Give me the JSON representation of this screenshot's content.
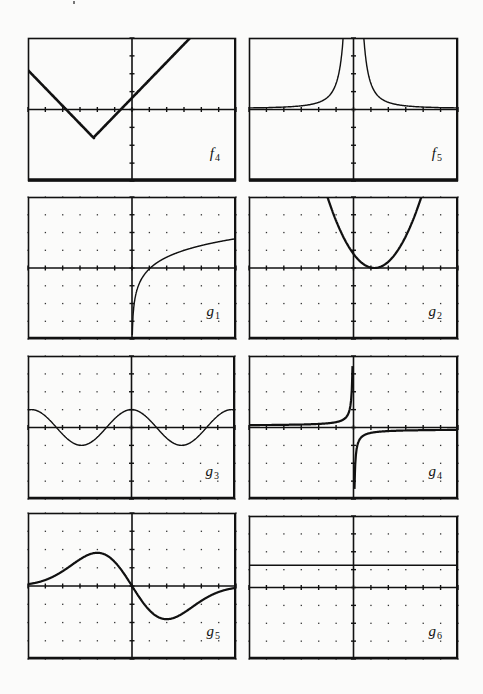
{
  "page": {
    "background": "#fbfbfa",
    "ink": "#111111"
  },
  "panels": [
    {
      "id": "f4",
      "name": "f",
      "sub": "4",
      "x": 28,
      "y": 38,
      "w": 208,
      "h": 143,
      "dots": false,
      "heavy": true
    },
    {
      "id": "f5",
      "name": "f",
      "sub": "5",
      "x": 249,
      "y": 38,
      "w": 209,
      "h": 143,
      "dots": false,
      "heavy": true
    },
    {
      "id": "g1",
      "name": "g",
      "sub": "1",
      "x": 28,
      "y": 197,
      "w": 208,
      "h": 142,
      "dots": true,
      "heavy": false
    },
    {
      "id": "g2",
      "name": "g",
      "sub": "2",
      "x": 249,
      "y": 197,
      "w": 209,
      "h": 142,
      "dots": true,
      "heavy": false
    },
    {
      "id": "g3",
      "name": "g",
      "sub": "3",
      "x": 28,
      "y": 356,
      "w": 207,
      "h": 143,
      "dots": true,
      "heavy": false
    },
    {
      "id": "g4",
      "name": "g",
      "sub": "4",
      "x": 249,
      "y": 356,
      "w": 209,
      "h": 143,
      "dots": true,
      "heavy": false
    },
    {
      "id": "g5",
      "name": "g",
      "sub": "5",
      "x": 28,
      "y": 513,
      "w": 208,
      "h": 146,
      "dots": true,
      "heavy": false
    },
    {
      "id": "g6",
      "name": "g",
      "sub": "6",
      "x": 249,
      "y": 516,
      "w": 209,
      "h": 143,
      "dots": true,
      "heavy": false
    }
  ],
  "chart_data": [
    {
      "type": "line",
      "title": "f4",
      "xlim": [
        -6,
        6
      ],
      "ylim": [
        -4,
        4
      ],
      "grid": "none",
      "description": "V-shaped absolute value graph with vertex at (-2.2,-1.6), slopes about ±1",
      "x": [
        -6,
        -2.2,
        3.5
      ],
      "y": [
        2.2,
        -1.6,
        4
      ]
    },
    {
      "type": "line",
      "title": "f5",
      "xlim": [
        -6,
        6
      ],
      "ylim": [
        -4,
        4
      ],
      "grid": "none",
      "description": "Even function with vertical asymptote at x=0, approaching y=0 from above (like 1/x^2)",
      "x": [
        -6,
        -4,
        -3,
        -2,
        -1.5,
        -1.1,
        1.1,
        1.5,
        2,
        3,
        4,
        6
      ],
      "y": [
        0.1,
        0.2,
        0.35,
        0.7,
        1.3,
        4,
        4,
        1.3,
        0.7,
        0.35,
        0.2,
        0.1
      ]
    },
    {
      "type": "line",
      "title": "g1",
      "xlim": [
        -6,
        6
      ],
      "ylim": [
        -4,
        4
      ],
      "grid": "dots",
      "description": "Logarithmic curve, vertical asymptote at x=0, crosses x-axis near x=1",
      "x": [
        0.05,
        0.2,
        0.5,
        1,
        2,
        3,
        4,
        5,
        6
      ],
      "y": [
        -2.4,
        -1.5,
        -0.5,
        0,
        0.7,
        1.05,
        1.3,
        1.5,
        1.7
      ]
    },
    {
      "type": "line",
      "title": "g2",
      "xlim": [
        -6,
        6
      ],
      "ylim": [
        -4,
        4
      ],
      "grid": "dots",
      "description": "Upward parabola with vertex at about (1.2, 0)",
      "x": [
        -1.9,
        -1,
        0,
        1.2,
        2,
        3,
        4.4
      ],
      "y": [
        4,
        2.2,
        0.7,
        0,
        0.3,
        1.6,
        4
      ]
    },
    {
      "type": "line",
      "title": "g3",
      "xlim": [
        -6,
        6
      ],
      "ylim": [
        -4,
        4
      ],
      "grid": "dots",
      "description": "Cosine wave, amplitude 1, period about 5.8",
      "x": [
        -6,
        -4.4,
        -2.9,
        -1.45,
        0,
        1.45,
        2.9,
        4.4,
        6
      ],
      "y": [
        1,
        0,
        -1,
        0,
        1,
        0,
        -1,
        0,
        1
      ]
    },
    {
      "type": "line",
      "title": "g4",
      "xlim": [
        -6,
        6
      ],
      "ylim": [
        -4,
        4
      ],
      "grid": "dots",
      "description": "Hyperbola-like curve, vertical asymptote at x=0, horizontal asymptote y=0; above on left, below on right",
      "x": [
        -6,
        -3,
        -1,
        -0.5,
        -0.2,
        0.2,
        0.5,
        1,
        3,
        6
      ],
      "y": [
        0.2,
        0.3,
        0.5,
        1,
        4,
        -4,
        -1,
        -0.5,
        -0.3,
        -0.2
      ]
    },
    {
      "type": "line",
      "title": "g5",
      "xlim": [
        -6,
        6
      ],
      "ylim": [
        -4,
        4
      ],
      "grid": "dots",
      "description": "Odd function through origin with max near (-2,2) and min near (2,-2), tending to 0",
      "x": [
        -6,
        -4,
        -3,
        -2.2,
        -1,
        0,
        1,
        2,
        3,
        4,
        6
      ],
      "y": [
        0.3,
        0.9,
        1.6,
        2.1,
        1.3,
        0,
        -1.5,
        -1.9,
        -1.4,
        -0.7,
        -0.2
      ]
    },
    {
      "type": "line",
      "title": "g6",
      "xlim": [
        -6,
        6
      ],
      "ylim": [
        -4,
        4
      ],
      "grid": "dots",
      "description": "Constant horizontal line y≈1.2",
      "x": [
        -6,
        6
      ],
      "y": [
        1.2,
        1.2
      ]
    }
  ]
}
